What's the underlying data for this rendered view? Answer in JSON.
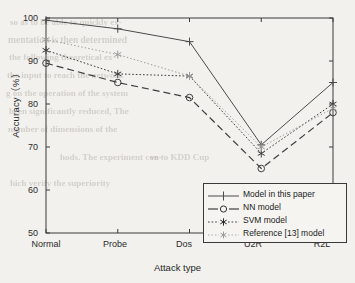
{
  "chart_data": {
    "type": "line",
    "title": "",
    "xlabel": "Attack type",
    "ylabel": "Accuracy（%）",
    "categories": [
      "Normal",
      "Probe",
      "Dos",
      "U2R",
      "R2L"
    ],
    "ylim": [
      50,
      100
    ],
    "yticks": [
      50,
      60,
      70,
      80,
      90,
      100
    ],
    "grid": false,
    "legend_position": "lower right",
    "series": [
      {
        "name": "Model in this paper",
        "values": [
          99.5,
          97.5,
          94.5,
          70.5,
          85.0
        ],
        "marker": "plus",
        "linestyle": "solid",
        "color": "#4a4a4a"
      },
      {
        "name": "NN model",
        "values": [
          89.5,
          85.0,
          81.5,
          65.0,
          78.0
        ],
        "marker": "circle",
        "linestyle": "dashed",
        "color": "#3f3f3f"
      },
      {
        "name": "SVM model",
        "values": [
          92.5,
          87.0,
          86.5,
          68.5,
          80.0
        ],
        "marker": "asterisk",
        "linestyle": "dashdot",
        "color": "#3a3a3a"
      },
      {
        "name": "Reference [13] model",
        "values": [
          95.0,
          91.5,
          86.5,
          70.0,
          79.0
        ],
        "marker": "asterisk",
        "linestyle": "dotted",
        "color": "#9a9a9a"
      }
    ]
  },
  "axis": {
    "ytick_labels": [
      "100",
      "90",
      "80",
      "70",
      "60",
      "50"
    ],
    "xtick_labels": [
      "Normal",
      "Probe",
      "Dos",
      "U2R",
      "R2L"
    ],
    "ylabel": "Accuracy（%）",
    "xlabel": "Attack type"
  },
  "legend": {
    "items": [
      {
        "label": "Model in this paper"
      },
      {
        "label": "NN model"
      },
      {
        "label": "SVM model"
      },
      {
        "label": "Reference [13] model"
      }
    ]
  },
  "background_artifacts": {
    "lines": [
      "so as to be able to quickly ex-",
      "mentation is then determined",
      "the following theoretical ex-",
      "the input to reach the network",
      "g on the operation of the system",
      "been significantly reduced, The",
      "number of dimensions of the",
      "hods. The experiment con-",
      "ve to KDD Cup",
      "hich verify the superiority"
    ]
  },
  "colors": {
    "paper": "#f2f1ee",
    "ink": "#2b2b2b",
    "ghost": "#b9b5ad",
    "light_series": "#9a9a9a"
  }
}
